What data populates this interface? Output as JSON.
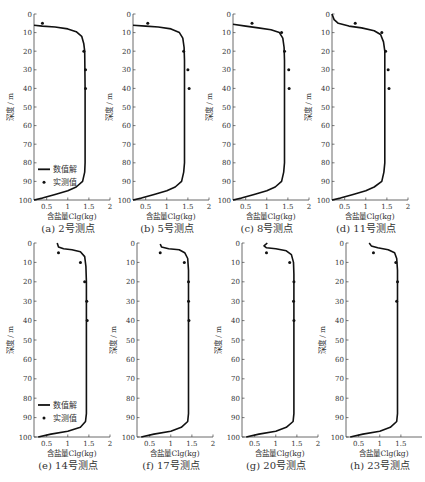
{
  "figure": {
    "x_label": "含盐量Clg(kg)",
    "y_label": "深度 / m",
    "legend": {
      "line": "数值解",
      "points": "实测值"
    },
    "line_color": "#111111",
    "point_color": "#111111"
  },
  "chart_data": [
    {
      "type": "line",
      "id": "a",
      "caption": "(a) 2号测点",
      "xlabel": "含盐量Clg(kg)",
      "ylabel": "深度 / m",
      "xlim": [
        0.2,
        2.0
      ],
      "ylim": [
        100,
        0
      ],
      "xticks": [
        0.5,
        1,
        1.5,
        2
      ],
      "yticks": [
        0,
        10,
        20,
        30,
        40,
        50,
        60,
        70,
        80,
        90,
        100
      ],
      "legend": true,
      "series": [
        {
          "name": "数值解",
          "kind": "line",
          "points": [
            [
              0.2,
              6
            ],
            [
              0.4,
              6.5
            ],
            [
              0.7,
              7
            ],
            [
              1.0,
              8
            ],
            [
              1.2,
              9.5
            ],
            [
              1.33,
              12
            ],
            [
              1.38,
              16
            ],
            [
              1.4,
              20
            ],
            [
              1.41,
              40
            ],
            [
              1.41,
              80
            ],
            [
              1.4,
              85
            ],
            [
              1.35,
              90
            ],
            [
              1.2,
              93
            ],
            [
              1.0,
              95
            ],
            [
              0.7,
              97
            ],
            [
              0.4,
              99
            ],
            [
              0.2,
              100
            ]
          ]
        },
        {
          "name": "实测值",
          "kind": "scatter",
          "points": [
            [
              0.4,
              5
            ],
            [
              1.38,
              20
            ],
            [
              1.42,
              30
            ],
            [
              1.42,
              40
            ]
          ]
        }
      ]
    },
    {
      "type": "line",
      "id": "b",
      "caption": "(b) 5号测点",
      "xlabel": "含盐量Clg(kg)",
      "ylabel": "深度 / m",
      "xlim": [
        0.2,
        2.0
      ],
      "ylim": [
        100,
        0
      ],
      "xticks": [
        0.5,
        1,
        1.5,
        2
      ],
      "yticks": [
        0,
        10,
        20,
        30,
        40,
        50,
        60,
        70,
        80,
        90,
        100
      ],
      "legend": false,
      "series": [
        {
          "name": "数值解",
          "kind": "line",
          "points": [
            [
              0.2,
              6
            ],
            [
              0.5,
              6.5
            ],
            [
              0.8,
              7
            ],
            [
              1.1,
              8
            ],
            [
              1.3,
              10
            ],
            [
              1.38,
              13
            ],
            [
              1.41,
              18
            ],
            [
              1.42,
              25
            ],
            [
              1.42,
              80
            ],
            [
              1.4,
              85
            ],
            [
              1.35,
              90
            ],
            [
              1.2,
              93
            ],
            [
              1.0,
              95
            ],
            [
              0.7,
              97
            ],
            [
              0.4,
              99
            ],
            [
              0.2,
              100
            ]
          ]
        },
        {
          "name": "实测值",
          "kind": "scatter",
          "points": [
            [
              0.55,
              5
            ],
            [
              1.4,
              20
            ],
            [
              1.5,
              30
            ],
            [
              1.53,
              40
            ]
          ]
        }
      ]
    },
    {
      "type": "line",
      "id": "c",
      "caption": "(c) 8号测点",
      "xlabel": "含盐量Clg(kg)",
      "ylabel": "深度 / m",
      "xlim": [
        0.2,
        2.0
      ],
      "ylim": [
        100,
        0
      ],
      "xticks": [
        0.5,
        1,
        1.5,
        2
      ],
      "yticks": [
        0,
        10,
        20,
        30,
        40,
        50,
        60,
        70,
        80,
        90,
        100
      ],
      "legend": false,
      "series": [
        {
          "name": "数值解",
          "kind": "line",
          "points": [
            [
              0.2,
              5.5
            ],
            [
              0.5,
              6.5
            ],
            [
              0.8,
              7.5
            ],
            [
              1.1,
              8.5
            ],
            [
              1.3,
              10
            ],
            [
              1.38,
              13
            ],
            [
              1.41,
              18
            ],
            [
              1.42,
              25
            ],
            [
              1.42,
              80
            ],
            [
              1.4,
              85
            ],
            [
              1.35,
              90
            ],
            [
              1.2,
              93
            ],
            [
              1.0,
              95
            ],
            [
              0.7,
              97
            ],
            [
              0.4,
              99
            ],
            [
              0.2,
              100
            ]
          ]
        },
        {
          "name": "实测值",
          "kind": "scatter",
          "points": [
            [
              0.65,
              5
            ],
            [
              1.35,
              10
            ],
            [
              1.42,
              20
            ],
            [
              1.52,
              30
            ],
            [
              1.53,
              40
            ]
          ]
        }
      ]
    },
    {
      "type": "line",
      "id": "d",
      "caption": "(d) 11号测点",
      "xlabel": "含盐量Clg(kg)",
      "ylabel": "深度 / m",
      "xlim": [
        0.2,
        2.0
      ],
      "ylim": [
        100,
        0
      ],
      "xticks": [
        0.5,
        1,
        1.5,
        2
      ],
      "yticks": [
        0,
        10,
        20,
        30,
        40,
        50,
        60,
        70,
        80,
        90,
        100
      ],
      "legend": false,
      "series": [
        {
          "name": "数值解",
          "kind": "line",
          "points": [
            [
              0.2,
              0
            ],
            [
              0.25,
              3
            ],
            [
              0.35,
              5
            ],
            [
              0.6,
              6.5
            ],
            [
              0.9,
              7.5
            ],
            [
              1.2,
              9
            ],
            [
              1.35,
              11
            ],
            [
              1.42,
              15
            ],
            [
              1.45,
              20
            ],
            [
              1.45,
              80
            ],
            [
              1.43,
              85
            ],
            [
              1.38,
              90
            ],
            [
              1.2,
              93
            ],
            [
              1.0,
              95
            ],
            [
              0.7,
              97
            ],
            [
              0.4,
              99
            ],
            [
              0.2,
              100
            ]
          ]
        },
        {
          "name": "实测值",
          "kind": "scatter",
          "points": [
            [
              0.75,
              5
            ],
            [
              1.38,
              10
            ],
            [
              1.47,
              20
            ],
            [
              1.53,
              30
            ],
            [
              1.55,
              40
            ]
          ]
        }
      ]
    },
    {
      "type": "line",
      "id": "e",
      "caption": "(e) 14号测点",
      "xlabel": "含盐量Clg(kg)",
      "ylabel": "深度 / m",
      "xlim": [
        0.2,
        2.0
      ],
      "ylim": [
        100,
        0
      ],
      "xticks": [
        0.5,
        1,
        1.5,
        2
      ],
      "yticks": [
        0,
        10,
        20,
        30,
        40,
        50,
        60,
        70,
        80,
        90,
        100
      ],
      "legend": true,
      "series": [
        {
          "name": "数值解",
          "kind": "line",
          "points": [
            [
              0.75,
              0
            ],
            [
              0.78,
              2
            ],
            [
              0.9,
              3
            ],
            [
              1.1,
              3.5
            ],
            [
              1.3,
              4.5
            ],
            [
              1.4,
              7
            ],
            [
              1.43,
              12
            ],
            [
              1.44,
              20
            ],
            [
              1.44,
              88
            ],
            [
              1.42,
              92
            ],
            [
              1.3,
              95
            ],
            [
              1.0,
              97
            ],
            [
              0.6,
              98.5
            ],
            [
              0.3,
              100
            ]
          ]
        },
        {
          "name": "实测值",
          "kind": "scatter",
          "points": [
            [
              0.78,
              5
            ],
            [
              1.3,
              10
            ],
            [
              1.4,
              20
            ],
            [
              1.45,
              30
            ],
            [
              1.46,
              40
            ]
          ]
        }
      ]
    },
    {
      "type": "line",
      "id": "f",
      "caption": "(f) 17号测点",
      "xlabel": "含盐量Clg(kg)",
      "ylabel": "深度 / m",
      "xlim": [
        0.2,
        2.0
      ],
      "ylim": [
        100,
        0
      ],
      "xticks": [
        0.5,
        1,
        1.5,
        2
      ],
      "yticks": [
        0,
        10,
        20,
        30,
        40,
        50,
        60,
        70,
        80,
        90,
        100
      ],
      "legend": false,
      "series": [
        {
          "name": "数值解",
          "kind": "line",
          "points": [
            [
              0.75,
              0.5
            ],
            [
              0.78,
              2
            ],
            [
              0.95,
              3
            ],
            [
              1.2,
              3.5
            ],
            [
              1.33,
              5
            ],
            [
              1.4,
              8
            ],
            [
              1.42,
              14
            ],
            [
              1.42,
              88
            ],
            [
              1.4,
              92
            ],
            [
              1.25,
              95
            ],
            [
              1.0,
              97
            ],
            [
              0.6,
              98.5
            ],
            [
              0.3,
              100
            ]
          ]
        },
        {
          "name": "实测值",
          "kind": "scatter",
          "points": [
            [
              0.75,
              5
            ],
            [
              1.32,
              10
            ],
            [
              1.42,
              20
            ],
            [
              1.42,
              30
            ],
            [
              1.43,
              40
            ]
          ]
        }
      ]
    },
    {
      "type": "line",
      "id": "g",
      "caption": "(g) 20号测点",
      "xlabel": "含盐量Clg(kg)",
      "ylabel": "深度 / m",
      "xlim": [
        0.2,
        2.0
      ],
      "ylim": [
        100,
        0
      ],
      "xticks": [
        0.5,
        1,
        1.5,
        2
      ],
      "yticks": [
        0,
        10,
        20,
        30,
        40,
        50,
        60,
        70,
        80,
        90,
        100
      ],
      "legend": false,
      "series": [
        {
          "name": "数值解",
          "kind": "line",
          "points": [
            [
              0.8,
              0
            ],
            [
              0.72,
              1.5
            ],
            [
              0.78,
              2.5
            ],
            [
              1.0,
              3
            ],
            [
              1.25,
              4
            ],
            [
              1.37,
              6
            ],
            [
              1.42,
              10
            ],
            [
              1.43,
              16
            ],
            [
              1.43,
              88
            ],
            [
              1.41,
              92
            ],
            [
              1.25,
              95
            ],
            [
              1.0,
              97
            ],
            [
              0.6,
              98.5
            ],
            [
              0.3,
              100
            ]
          ]
        },
        {
          "name": "实测值",
          "kind": "scatter",
          "points": [
            [
              0.78,
              5
            ],
            [
              1.33,
              10
            ],
            [
              1.43,
              20
            ],
            [
              1.42,
              30
            ],
            [
              1.43,
              40
            ]
          ]
        }
      ]
    },
    {
      "type": "line",
      "id": "h",
      "caption": "(h) 23号测点",
      "xlabel": "含盐量Clg(kg)",
      "ylabel": "深度 / m",
      "xlim": [
        0.2,
        2.0
      ],
      "ylim": [
        100,
        0
      ],
      "xticks": [
        0.5,
        1,
        1.5
      ],
      "yticks": [
        0,
        10,
        20,
        30,
        40,
        50,
        60,
        70,
        80,
        90,
        100
      ],
      "legend": false,
      "series": [
        {
          "name": "数值解",
          "kind": "line",
          "points": [
            [
              0.75,
              0
            ],
            [
              0.8,
              1.5
            ],
            [
              0.95,
              2.5
            ],
            [
              1.2,
              3.5
            ],
            [
              1.35,
              5
            ],
            [
              1.4,
              8
            ],
            [
              1.42,
              14
            ],
            [
              1.42,
              88
            ],
            [
              1.4,
              92
            ],
            [
              1.25,
              95
            ],
            [
              1.0,
              97
            ],
            [
              0.6,
              98.5
            ],
            [
              0.3,
              100
            ]
          ]
        },
        {
          "name": "实测值",
          "kind": "scatter",
          "points": [
            [
              0.85,
              5
            ],
            [
              1.38,
              10
            ],
            [
              1.42,
              20
            ],
            [
              1.4,
              30
            ]
          ]
        }
      ]
    }
  ]
}
